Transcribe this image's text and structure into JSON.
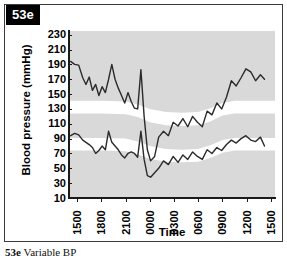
{
  "figure": {
    "panel_tag": "53e",
    "caption_number": "53e",
    "caption_text": "Variable BP"
  },
  "chart_data": {
    "type": "line",
    "title": "",
    "subtitle": "",
    "xlabel": "Time",
    "ylabel": "Blood pressure (mmHg)",
    "ylim": [
      10,
      235
    ],
    "yticks": [
      230,
      210,
      190,
      170,
      150,
      130,
      110,
      90,
      70,
      50,
      30,
      10
    ],
    "xticks": [
      "1500",
      "1800",
      "2100",
      "0000",
      "0300",
      "0600",
      "0900",
      "1200",
      "1500"
    ],
    "xlim_hours": [
      14.0,
      39.5
    ],
    "grid": false,
    "legend": false,
    "plot_background": "#d9d9d9",
    "band_color": "#ffffff",
    "line_color": "#2b2b2b",
    "normal_bands": [
      {
        "name": "systolic-normal-band",
        "points": [
          {
            "t": 14.0,
            "upper": 141,
            "lower": 124
          },
          {
            "t": 18.0,
            "upper": 141,
            "lower": 124
          },
          {
            "t": 21.0,
            "upper": 140,
            "lower": 123
          },
          {
            "t": 22.5,
            "upper": 136,
            "lower": 119
          },
          {
            "t": 24.0,
            "upper": 130,
            "lower": 112
          },
          {
            "t": 26.0,
            "upper": 126,
            "lower": 108
          },
          {
            "t": 28.0,
            "upper": 125,
            "lower": 107
          },
          {
            "t": 30.0,
            "upper": 126,
            "lower": 108
          },
          {
            "t": 31.5,
            "upper": 131,
            "lower": 113
          },
          {
            "t": 33.0,
            "upper": 138,
            "lower": 121
          },
          {
            "t": 34.5,
            "upper": 141,
            "lower": 124
          },
          {
            "t": 39.5,
            "upper": 141,
            "lower": 124
          }
        ]
      },
      {
        "name": "diastolic-normal-band",
        "points": [
          {
            "t": 14.0,
            "upper": 91,
            "lower": 74
          },
          {
            "t": 18.0,
            "upper": 91,
            "lower": 74
          },
          {
            "t": 21.0,
            "upper": 90,
            "lower": 73
          },
          {
            "t": 22.5,
            "upper": 86,
            "lower": 69
          },
          {
            "t": 24.0,
            "upper": 80,
            "lower": 63
          },
          {
            "t": 26.0,
            "upper": 76,
            "lower": 59
          },
          {
            "t": 28.0,
            "upper": 75,
            "lower": 58
          },
          {
            "t": 30.0,
            "upper": 76,
            "lower": 59
          },
          {
            "t": 31.5,
            "upper": 81,
            "lower": 64
          },
          {
            "t": 33.0,
            "upper": 88,
            "lower": 71
          },
          {
            "t": 34.5,
            "upper": 91,
            "lower": 74
          },
          {
            "t": 39.5,
            "upper": 91,
            "lower": 74
          }
        ]
      }
    ],
    "series": [
      {
        "name": "Systolic blood pressure",
        "x": [
          14.2,
          14.7,
          15.2,
          15.7,
          16.1,
          16.5,
          16.9,
          17.3,
          17.7,
          18.1,
          18.5,
          18.9,
          19.3,
          19.7,
          20.1,
          20.5,
          20.9,
          21.3,
          21.7,
          22.1,
          22.5,
          22.9,
          23.3,
          23.7,
          24.1,
          24.6,
          25.1,
          25.7,
          26.3,
          26.9,
          27.5,
          28.1,
          28.7,
          29.3,
          29.9,
          30.5,
          31.1,
          31.7,
          32.3,
          32.9,
          33.5,
          34.1,
          34.7,
          35.3,
          35.9,
          36.5,
          37.1,
          37.7,
          38.2
        ],
        "values": [
          194,
          190,
          189,
          172,
          163,
          173,
          155,
          163,
          148,
          160,
          152,
          170,
          190,
          170,
          158,
          148,
          138,
          152,
          140,
          131,
          130,
          183,
          120,
          75,
          60,
          66,
          92,
          100,
          94,
          112,
          107,
          117,
          106,
          120,
          112,
          106,
          127,
          122,
          138,
          130,
          146,
          168,
          161,
          172,
          184,
          180,
          168,
          176,
          170
        ]
      },
      {
        "name": "Diastolic blood pressure",
        "x": [
          14.2,
          14.7,
          15.2,
          15.7,
          16.1,
          16.5,
          16.9,
          17.3,
          17.7,
          18.1,
          18.5,
          18.9,
          19.3,
          19.7,
          20.1,
          20.5,
          20.9,
          21.3,
          21.7,
          22.1,
          22.5,
          22.9,
          23.3,
          23.7,
          24.1,
          24.6,
          25.1,
          25.7,
          26.3,
          26.9,
          27.5,
          28.1,
          28.7,
          29.3,
          29.9,
          30.5,
          31.1,
          31.7,
          32.3,
          32.9,
          33.5,
          34.1,
          34.7,
          35.3,
          35.9,
          36.5,
          37.1,
          37.7,
          38.2
        ],
        "values": [
          94,
          97,
          95,
          88,
          85,
          82,
          78,
          70,
          74,
          80,
          75,
          100,
          85,
          80,
          75,
          68,
          64,
          70,
          72,
          70,
          65,
          100,
          62,
          40,
          38,
          44,
          50,
          60,
          55,
          66,
          58,
          68,
          62,
          72,
          66,
          62,
          75,
          70,
          78,
          74,
          82,
          88,
          84,
          90,
          94,
          88,
          86,
          92,
          80
        ]
      }
    ]
  }
}
